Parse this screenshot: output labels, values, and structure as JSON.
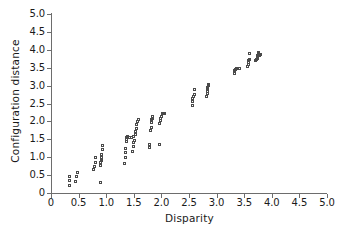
{
  "chart_data": {
    "type": "scatter",
    "title": "",
    "xlabel": "Disparity",
    "ylabel": "Configuration distance",
    "xlim": [
      0,
      5.0
    ],
    "ylim": [
      0,
      5.0
    ],
    "xticks": [
      "0",
      "0.5",
      "1.0",
      "1.5",
      "2.0",
      "2.5",
      "3.0",
      "3.5",
      "4.0",
      "4.5",
      "5.0"
    ],
    "xtick_values": [
      0,
      0.5,
      1.0,
      1.5,
      2.0,
      2.5,
      3.0,
      3.5,
      4.0,
      4.5,
      5.0
    ],
    "yticks": [
      "0",
      "0.5",
      "1.0",
      "1.5",
      "2.0",
      "2.5",
      "3.0",
      "3.5",
      "4.0",
      "4.5",
      "5.0"
    ],
    "ytick_values": [
      0,
      0.5,
      1.0,
      1.5,
      2.0,
      2.5,
      3.0,
      3.5,
      4.0,
      4.5,
      5.0
    ],
    "grid": false,
    "legend": null,
    "marker": "open-square",
    "marker_color": "#4a4a4a",
    "points": [
      [
        0.35,
        0.18
      ],
      [
        0.35,
        0.33
      ],
      [
        0.36,
        0.44
      ],
      [
        0.47,
        0.3
      ],
      [
        0.48,
        0.42
      ],
      [
        0.49,
        0.55
      ],
      [
        0.78,
        0.62
      ],
      [
        0.8,
        0.7
      ],
      [
        0.82,
        0.83
      ],
      [
        0.83,
        0.95
      ],
      [
        0.92,
        0.27
      ],
      [
        0.92,
        0.73
      ],
      [
        0.92,
        0.82
      ],
      [
        0.93,
        0.88
      ],
      [
        0.93,
        0.92
      ],
      [
        0.93,
        0.97
      ],
      [
        0.94,
        1.05
      ],
      [
        0.95,
        1.18
      ],
      [
        0.96,
        1.3
      ],
      [
        1.35,
        0.8
      ],
      [
        1.36,
        0.97
      ],
      [
        1.37,
        1.1
      ],
      [
        1.37,
        1.22
      ],
      [
        1.38,
        1.42
      ],
      [
        1.38,
        1.48
      ],
      [
        1.39,
        1.52
      ],
      [
        1.4,
        1.56
      ],
      [
        1.44,
        1.52
      ],
      [
        1.48,
        1.53
      ],
      [
        1.52,
        1.55
      ],
      [
        1.5,
        1.13
      ],
      [
        1.51,
        1.27
      ],
      [
        1.52,
        1.38
      ],
      [
        1.53,
        1.45
      ],
      [
        1.54,
        1.62
      ],
      [
        1.55,
        1.7
      ],
      [
        1.56,
        1.78
      ],
      [
        1.57,
        1.88
      ],
      [
        1.58,
        1.97
      ],
      [
        1.6,
        2.03
      ],
      [
        1.8,
        1.25
      ],
      [
        1.81,
        1.32
      ],
      [
        1.82,
        1.72
      ],
      [
        1.83,
        1.8
      ],
      [
        1.84,
        1.95
      ],
      [
        1.84,
        2.02
      ],
      [
        1.85,
        2.06
      ],
      [
        1.86,
        2.1
      ],
      [
        1.98,
        1.32
      ],
      [
        1.99,
        1.92
      ],
      [
        2.0,
        2.0
      ],
      [
        2.01,
        2.05
      ],
      [
        2.02,
        2.12
      ],
      [
        2.03,
        2.18
      ],
      [
        2.05,
        2.2
      ],
      [
        2.08,
        2.19
      ],
      [
        2.58,
        2.42
      ],
      [
        2.58,
        2.52
      ],
      [
        2.59,
        2.6
      ],
      [
        2.6,
        2.66
      ],
      [
        2.61,
        2.72
      ],
      [
        2.62,
        2.86
      ],
      [
        2.84,
        2.66
      ],
      [
        2.85,
        2.74
      ],
      [
        2.85,
        2.82
      ],
      [
        2.86,
        2.88
      ],
      [
        2.86,
        2.93
      ],
      [
        2.87,
        2.97
      ],
      [
        2.88,
        3.0
      ],
      [
        3.34,
        3.32
      ],
      [
        3.35,
        3.38
      ],
      [
        3.36,
        3.42
      ],
      [
        3.37,
        3.46
      ],
      [
        3.4,
        3.44
      ],
      [
        3.43,
        3.45
      ],
      [
        3.58,
        3.5
      ],
      [
        3.59,
        3.57
      ],
      [
        3.6,
        3.62
      ],
      [
        3.6,
        3.66
      ],
      [
        3.61,
        3.7
      ],
      [
        3.62,
        3.88
      ],
      [
        3.73,
        3.66
      ],
      [
        3.74,
        3.7
      ],
      [
        3.75,
        3.74
      ],
      [
        3.75,
        3.78
      ],
      [
        3.76,
        3.82
      ],
      [
        3.77,
        3.86
      ],
      [
        3.78,
        3.9
      ],
      [
        3.8,
        3.8
      ],
      [
        3.81,
        3.85
      ]
    ]
  }
}
